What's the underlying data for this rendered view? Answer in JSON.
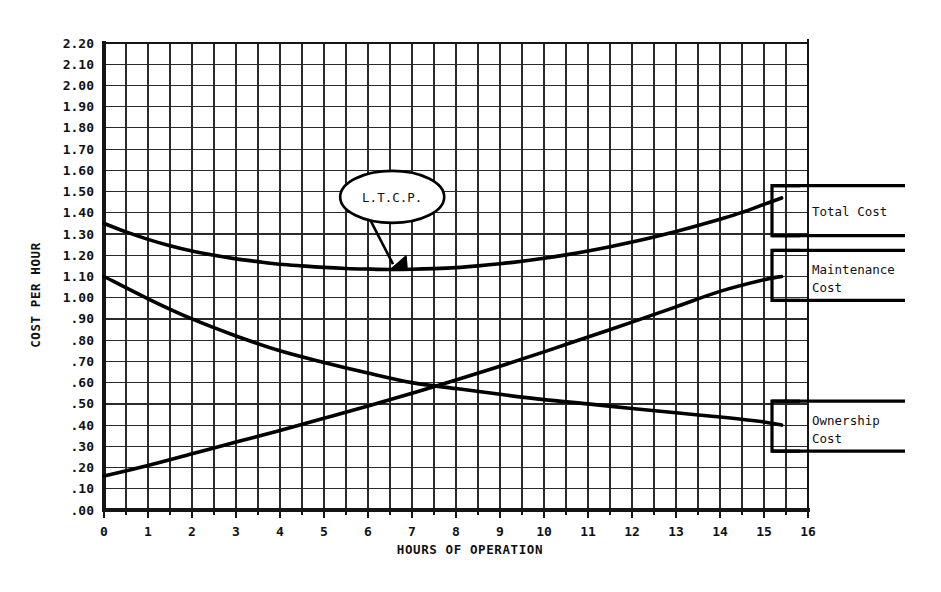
{
  "chart_data": {
    "type": "line",
    "title": "",
    "xlabel": "HOURS OF OPERATION",
    "ylabel": "COST PER HOUR",
    "xlim": [
      0,
      16
    ],
    "ylim": [
      0.0,
      2.2
    ],
    "grid": true,
    "grid_x_step": 0.5,
    "grid_y_step": 0.1,
    "x_ticks": [
      "0",
      "1",
      "2",
      "3",
      "4",
      "5",
      "6",
      "7",
      "8",
      "9",
      "10",
      "11",
      "12",
      "13",
      "14",
      "15",
      "16"
    ],
    "y_ticks": [
      ".00",
      ".10",
      ".20",
      ".30",
      ".40",
      ".50",
      ".60",
      ".70",
      ".80",
      ".90",
      "1.00",
      "1.10",
      "1.20",
      "1.30",
      "1.40",
      "1.50",
      "1.60",
      "1.70",
      "1.80",
      "1.90",
      "2.00",
      "2.10",
      "2.20"
    ],
    "legend_position": "right-outside",
    "annotations": [
      {
        "text": "L.T.C.P.",
        "shape": "ellipse",
        "x": 6.55,
        "y": 1.475,
        "points_to_x": 6.5,
        "points_to_y": 1.135
      }
    ],
    "series": [
      {
        "name": "Total Cost",
        "color": "#000000",
        "x": [
          0,
          0.5,
          1,
          1.5,
          2,
          2.5,
          3,
          3.5,
          4,
          4.5,
          5,
          5.5,
          6,
          6.5,
          7,
          7.5,
          8,
          8.5,
          9,
          9.5,
          10,
          10.5,
          11,
          11.5,
          12,
          12.5,
          13,
          13.5,
          14,
          14.5,
          15,
          15.4
        ],
        "values": [
          1.35,
          1.31,
          1.275,
          1.245,
          1.22,
          1.2,
          1.183,
          1.17,
          1.158,
          1.15,
          1.143,
          1.138,
          1.135,
          1.133,
          1.134,
          1.137,
          1.142,
          1.15,
          1.16,
          1.172,
          1.186,
          1.202,
          1.22,
          1.24,
          1.262,
          1.286,
          1.312,
          1.34,
          1.37,
          1.402,
          1.44,
          1.47
        ]
      },
      {
        "name": "Maintenance Cost",
        "color": "#000000",
        "x": [
          0,
          1,
          2,
          3,
          4,
          5,
          6,
          7,
          8,
          9,
          10,
          11,
          12,
          13,
          14,
          15,
          15.4
        ],
        "values": [
          0.16,
          0.21,
          0.265,
          0.32,
          0.375,
          0.432,
          0.49,
          0.55,
          0.612,
          0.677,
          0.745,
          0.815,
          0.885,
          0.957,
          1.03,
          1.085,
          1.1
        ]
      },
      {
        "name": "Ownership Cost",
        "color": "#000000",
        "x": [
          0,
          1,
          2,
          3,
          4,
          5,
          6,
          7,
          8,
          9,
          10,
          11,
          12,
          13,
          14,
          15,
          15.4
        ],
        "values": [
          1.1,
          0.995,
          0.9,
          0.82,
          0.75,
          0.695,
          0.645,
          0.6,
          0.572,
          0.545,
          0.52,
          0.5,
          0.478,
          0.458,
          0.438,
          0.415,
          0.4
        ]
      }
    ]
  },
  "legend": {
    "items": [
      {
        "label_line1": "Total Cost",
        "label_line2": "",
        "value_y": 1.41
      },
      {
        "label_line1": "Maintenance",
        "label_line2": "Cost",
        "value_y": 1.105
      },
      {
        "label_line1": "Ownership",
        "label_line2": "Cost",
        "value_y": 0.395
      }
    ]
  },
  "colors": {
    "ink": "#151515",
    "grid": "#2a2a2a",
    "background": "#ffffff"
  }
}
